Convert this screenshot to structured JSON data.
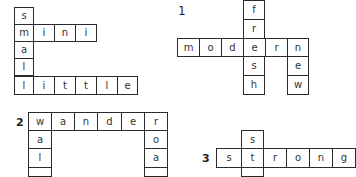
{
  "puzzles": [
    {
      "id": "example",
      "number": "",
      "cells": [
        {
          "ch": "s",
          "x": 14,
          "y": 7,
          "w": 20,
          "h": 18
        },
        {
          "ch": "m",
          "x": 14,
          "y": 24,
          "w": 20,
          "h": 18
        },
        {
          "ch": "i",
          "x": 33,
          "y": 24,
          "w": 22,
          "h": 18
        },
        {
          "ch": "n",
          "x": 54,
          "y": 24,
          "w": 22,
          "h": 18
        },
        {
          "ch": "i",
          "x": 75,
          "y": 24,
          "w": 22,
          "h": 18
        },
        {
          "ch": "a",
          "x": 14,
          "y": 41,
          "w": 20,
          "h": 18
        },
        {
          "ch": "l",
          "x": 14,
          "y": 58,
          "w": 20,
          "h": 18
        },
        {
          "ch": "l",
          "x": 14,
          "y": 76,
          "w": 20,
          "h": 19
        },
        {
          "ch": "i",
          "x": 33,
          "y": 76,
          "w": 22,
          "h": 19
        },
        {
          "ch": "t",
          "x": 54,
          "y": 76,
          "w": 22,
          "h": 19
        },
        {
          "ch": "t",
          "x": 75,
          "y": 76,
          "w": 22,
          "h": 19
        },
        {
          "ch": "l",
          "x": 96,
          "y": 76,
          "w": 22,
          "h": 19
        },
        {
          "ch": "e",
          "x": 117,
          "y": 76,
          "w": 21,
          "h": 19
        }
      ]
    },
    {
      "id": "puzzle-1",
      "number": "1",
      "number_pos": {
        "x": 178,
        "y": 4
      },
      "cells": [
        {
          "ch": "f",
          "x": 243,
          "y": 0,
          "w": 22,
          "h": 20
        },
        {
          "ch": "r",
          "x": 243,
          "y": 19,
          "w": 22,
          "h": 20
        },
        {
          "ch": "m",
          "x": 177,
          "y": 38,
          "w": 23,
          "h": 19
        },
        {
          "ch": "o",
          "x": 199,
          "y": 38,
          "w": 23,
          "h": 19
        },
        {
          "ch": "d",
          "x": 221,
          "y": 38,
          "w": 23,
          "h": 19
        },
        {
          "ch": "e",
          "x": 243,
          "y": 38,
          "w": 23,
          "h": 19
        },
        {
          "ch": "r",
          "x": 265,
          "y": 38,
          "w": 23,
          "h": 19
        },
        {
          "ch": "n",
          "x": 287,
          "y": 38,
          "w": 22,
          "h": 19
        },
        {
          "ch": "s",
          "x": 243,
          "y": 56,
          "w": 22,
          "h": 20
        },
        {
          "ch": "h",
          "x": 243,
          "y": 75,
          "w": 22,
          "h": 20
        },
        {
          "ch": "e",
          "x": 287,
          "y": 56,
          "w": 22,
          "h": 20
        },
        {
          "ch": "w",
          "x": 287,
          "y": 75,
          "w": 22,
          "h": 20
        }
      ]
    },
    {
      "id": "puzzle-2",
      "number": "2",
      "number_pos": {
        "x": 16,
        "y": 116
      },
      "cells": [
        {
          "ch": "w",
          "x": 28,
          "y": 112,
          "w": 24,
          "h": 19
        },
        {
          "ch": "a",
          "x": 51,
          "y": 112,
          "w": 24,
          "h": 19
        },
        {
          "ch": "n",
          "x": 74,
          "y": 112,
          "w": 24,
          "h": 19
        },
        {
          "ch": "d",
          "x": 97,
          "y": 112,
          "w": 25,
          "h": 19
        },
        {
          "ch": "e",
          "x": 121,
          "y": 112,
          "w": 24,
          "h": 19
        },
        {
          "ch": "r",
          "x": 144,
          "y": 112,
          "w": 24,
          "h": 19
        },
        {
          "ch": "a",
          "x": 28,
          "y": 130,
          "w": 24,
          "h": 19
        },
        {
          "ch": "l",
          "x": 28,
          "y": 148,
          "w": 24,
          "h": 20
        },
        {
          "ch": "",
          "x": 28,
          "y": 167,
          "w": 24,
          "h": 10
        },
        {
          "ch": "o",
          "x": 144,
          "y": 130,
          "w": 24,
          "h": 19
        },
        {
          "ch": "a",
          "x": 144,
          "y": 148,
          "w": 24,
          "h": 20
        },
        {
          "ch": "",
          "x": 144,
          "y": 167,
          "w": 24,
          "h": 10
        }
      ]
    },
    {
      "id": "puzzle-3",
      "number": "3",
      "number_pos": {
        "x": 202,
        "y": 152
      },
      "cells": [
        {
          "ch": "s",
          "x": 241,
          "y": 130,
          "w": 23,
          "h": 19
        },
        {
          "ch": "s",
          "x": 216,
          "y": 148,
          "w": 26,
          "h": 20
        },
        {
          "ch": "t",
          "x": 241,
          "y": 148,
          "w": 23,
          "h": 20
        },
        {
          "ch": "r",
          "x": 263,
          "y": 148,
          "w": 24,
          "h": 20
        },
        {
          "ch": "o",
          "x": 286,
          "y": 148,
          "w": 24,
          "h": 20
        },
        {
          "ch": "n",
          "x": 309,
          "y": 148,
          "w": 24,
          "h": 20
        },
        {
          "ch": "g",
          "x": 332,
          "y": 148,
          "w": 24,
          "h": 20
        },
        {
          "ch": "",
          "x": 241,
          "y": 167,
          "w": 23,
          "h": 10
        }
      ]
    }
  ]
}
